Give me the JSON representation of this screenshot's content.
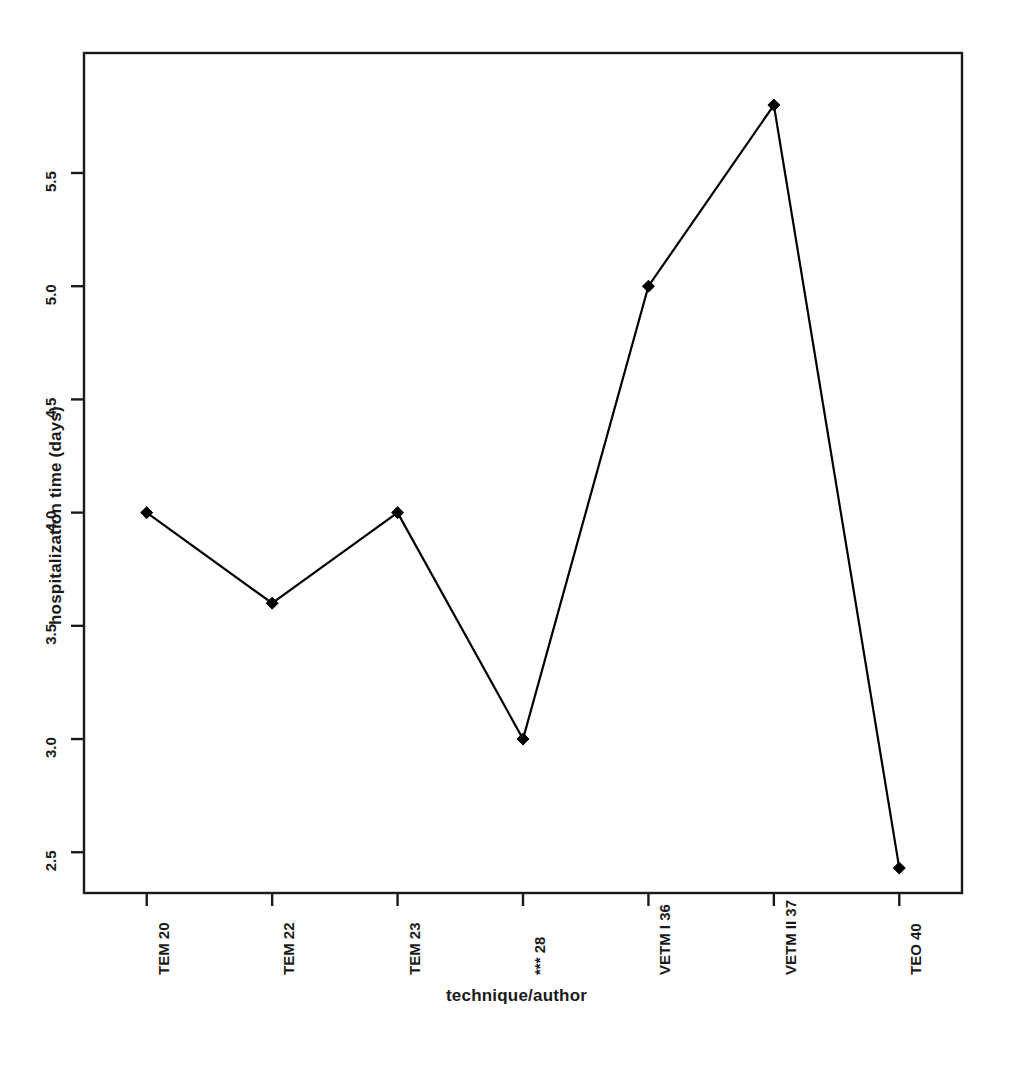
{
  "chart_data": {
    "type": "line",
    "title": "",
    "xlabel": "technique/author",
    "ylabel": "hospitalization time (days)",
    "categories": [
      "TEM 20",
      "TEM 22",
      "TEM 23",
      "*** 28",
      "VETM I 36",
      "VETM II 37",
      "TEO 40"
    ],
    "values": [
      4.0,
      3.6,
      4.0,
      3.0,
      5.0,
      5.8,
      2.43
    ],
    "series": [
      {
        "name": "hospitalization time",
        "values": [
          4.0,
          3.6,
          4.0,
          3.0,
          5.0,
          5.8,
          2.43
        ]
      }
    ],
    "ytick_labels": [
      "2.5",
      "3.0",
      "3.5",
      "4.0",
      "4.5",
      "5.0",
      "5.5"
    ],
    "ytick_values": [
      2.5,
      3.0,
      3.5,
      4.0,
      4.5,
      5.0,
      5.5
    ],
    "ylim": [
      2.32,
      6.03
    ],
    "xlim": [
      0.5,
      7.5
    ],
    "grid": false,
    "legend": false,
    "legend_position": "none",
    "marker": "diamond",
    "line_color": "#000000",
    "marker_color": "#000000",
    "frame_color": "#1a1a1a",
    "background_color": "#ffffff"
  }
}
